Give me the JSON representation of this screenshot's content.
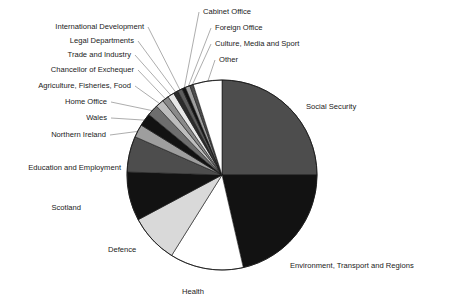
{
  "chart_data": {
    "type": "pie",
    "title": "",
    "subtitle": "",
    "xlabel": "",
    "ylabel": "",
    "legend_position": "callout-labels",
    "grid": false,
    "start_angle_deg": 0,
    "direction": "clockwise",
    "center": {
      "x": 222,
      "y": 175
    },
    "radius": 95,
    "categories": [
      "Social Security",
      "Environment, Transport and Regions",
      "Health",
      "Defence",
      "Scotland",
      "Education and Employment",
      "Northern Ireland",
      "Wales",
      "Home Office",
      "Agriculture, Fisheries, Food",
      "Chancellor of Exchequer",
      "Trade and Industry",
      "Legal Departments",
      "International Development",
      "Cabinet Office",
      "Foreign Office",
      "Culture, Media and Sport",
      "Other"
    ],
    "values": [
      25.0,
      21.4,
      12.5,
      8.3,
      8.3,
      6.1,
      2.2,
      2.2,
      1.9,
      1.4,
      1.1,
      1.1,
      0.8,
      0.8,
      0.6,
      0.8,
      0.6,
      4.9
    ],
    "units": "percent of total",
    "colors": [
      "#4d4d4d",
      "#121212",
      "#ffffff",
      "#d9d9d9",
      "#121212",
      "#4d4d4d",
      "#9e9e9e",
      "#121212",
      "#6e6e6e",
      "#bdbdbd",
      "#8a8a8a",
      "#e8e8e8",
      "#2b2b2b",
      "#5c5c5c",
      "#121212",
      "#9e9e9e",
      "#4d4d4d",
      "#ffffff"
    ]
  },
  "labels": {
    "social_security": "Social Security",
    "environment": "Environment, Transport and Regions",
    "health": "Health",
    "defence": "Defence",
    "scotland": "Scotland",
    "education": "Education and Employment",
    "northern_ireland": "Northern Ireland",
    "wales": "Wales",
    "home_office": "Home Office",
    "agriculture": "Agriculture, Fisheries, Food",
    "chancellor": "Chancellor of Exchequer",
    "trade": "Trade and Industry",
    "legal": "Legal Departments",
    "international_development": "International Development",
    "cabinet_office": "Cabinet Office",
    "foreign_office": "Foreign Office",
    "culture": "Culture, Media and Sport",
    "other": "Other"
  }
}
